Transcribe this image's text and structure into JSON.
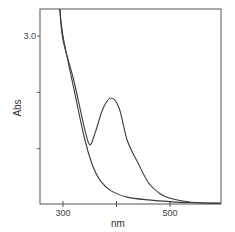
{
  "chart_data": {
    "type": "line",
    "title": "",
    "xlabel": "nm",
    "ylabel": "Abs",
    "xlim": [
      257,
      595
    ],
    "ylim": [
      0,
      3.48
    ],
    "x_ticks": [
      300,
      400,
      500
    ],
    "x_tick_labels": [
      "300",
      "",
      "500"
    ],
    "y_ticks": [
      1.0,
      2.0,
      3.0
    ],
    "y_tick_labels": [
      "",
      "",
      "3.0"
    ],
    "grid": false,
    "legend": null,
    "series": [
      {
        "name": "spectrum with band",
        "x": [
          294,
          300,
          320,
          340,
          350,
          360,
          375,
          390,
          405,
          420,
          440,
          460,
          480,
          500,
          540,
          595
        ],
        "y": [
          3.48,
          2.93,
          2.22,
          1.37,
          1.07,
          1.28,
          1.72,
          1.9,
          1.72,
          1.15,
          0.75,
          0.39,
          0.21,
          0.12,
          0.05,
          0.03
        ]
      },
      {
        "name": "baseline spectrum",
        "x": [
          294,
          300,
          320,
          340,
          355,
          370,
          390,
          420,
          460,
          500,
          540,
          595
        ],
        "y": [
          3.48,
          3.0,
          2.08,
          1.19,
          0.71,
          0.43,
          0.25,
          0.14,
          0.09,
          0.06,
          0.04,
          0.03
        ]
      }
    ],
    "colors": {
      "line": "#3a3a3a",
      "axis": "#555555",
      "background": "#ffffff"
    }
  },
  "labels": {
    "x_axis": "nm",
    "y_axis": "Abs",
    "y_tick_top": "3.0",
    "x_tick_300": "300",
    "x_tick_500": "500"
  }
}
